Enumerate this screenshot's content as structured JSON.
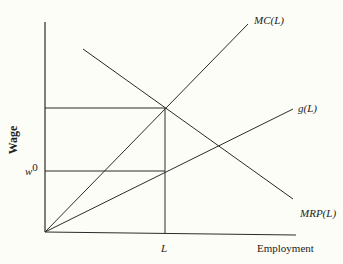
{
  "diagram": {
    "y_axis_label": "Wage",
    "x_axis_label": "Employment",
    "tick_x_label": "L",
    "tick_y_label_base": "w",
    "tick_y_label_sup": "0",
    "curves": {
      "mc": {
        "label": "MC(L)"
      },
      "g": {
        "label": "g(L)"
      },
      "mrp": {
        "label": "MRP(L)"
      }
    },
    "colors": {
      "line": "#2b2b2b",
      "background": "#fdfdf7"
    }
  }
}
